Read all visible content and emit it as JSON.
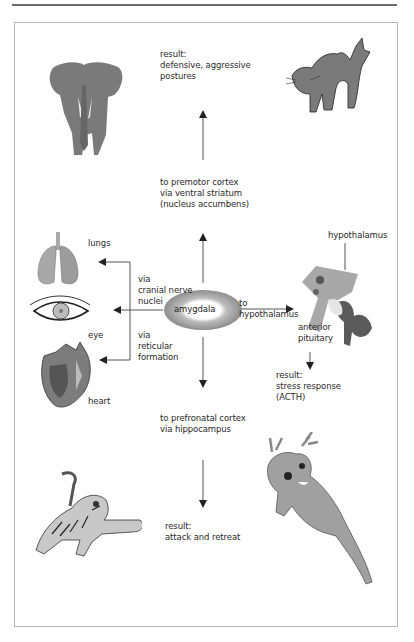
{
  "diagram": {
    "center": {
      "label": "amygdala"
    },
    "pathways": {
      "up": {
        "label": "to premotor cortex\nvia ventral striatum\n(nucleus accumbens)",
        "result": "result:\ndefensive, aggressive\npostures",
        "images": [
          "elephant",
          "frightened cat"
        ]
      },
      "left_upper": {
        "label": "via\ncranial nerve\nnuclei"
      },
      "left_lower": {
        "label": "via\nreticular\nformation"
      },
      "organs": [
        {
          "label": "lungs"
        },
        {
          "label": "eye"
        },
        {
          "label": "heart"
        }
      ],
      "right": {
        "label": "to\nhypothalamus",
        "structure_labels": {
          "hypothalamus": "hypothalamus",
          "pituitary": "anterior\npituitary"
        },
        "result": "result:\nstress response\n(ACTH)"
      },
      "down": {
        "label": "to prefronatal cortex\nvia hippocampus",
        "result": "result:\nattack and retreat",
        "images": [
          "tiger",
          "deer"
        ]
      }
    },
    "colors": {
      "line": "#555555",
      "gray_fill": "#8a8a8a",
      "light_gray": "#c8c8c8",
      "frame": "#b5b5b5"
    }
  }
}
